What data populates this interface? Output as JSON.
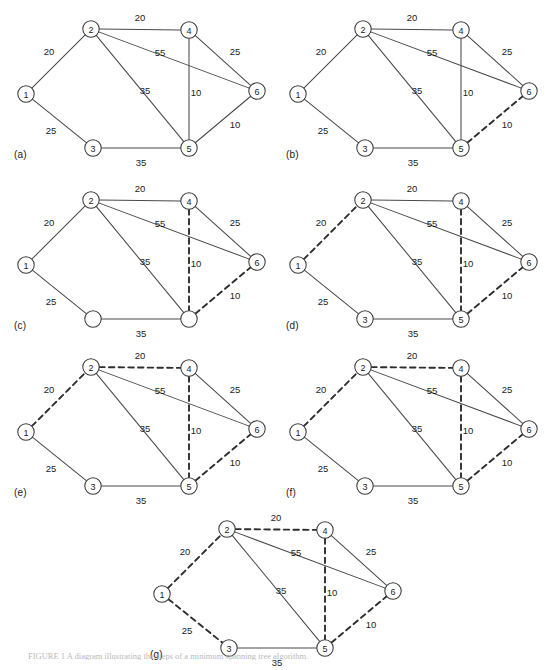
{
  "figure": {
    "caption_bottom": "FIGURE 1 A diagram illustrating the steps of a minimum spanning tree algorithm.",
    "node_radius": 8.2,
    "nodes": [
      {
        "id": "1",
        "label": "1",
        "x": 26,
        "y": 94
      },
      {
        "id": "2",
        "label": "2",
        "x": 91,
        "y": 29
      },
      {
        "id": "3",
        "label": "3",
        "x": 93,
        "y": 148
      },
      {
        "id": "4",
        "label": "4",
        "x": 189,
        "y": 30
      },
      {
        "id": "5",
        "label": "5",
        "x": 189,
        "y": 148
      },
      {
        "id": "6",
        "label": "6",
        "x": 257,
        "y": 91
      }
    ],
    "edges": [
      {
        "id": "1-2",
        "from": "1",
        "to": "2",
        "weight": "20",
        "lx": 49,
        "ly": 51
      },
      {
        "id": "1-3",
        "from": "1",
        "to": "3",
        "weight": "25",
        "lx": 51,
        "ly": 130
      },
      {
        "id": "2-4",
        "from": "2",
        "to": "4",
        "weight": "20",
        "lx": 140,
        "ly": 17
      },
      {
        "id": "2-6",
        "from": "2",
        "to": "6",
        "weight": "55",
        "lx": 160,
        "ly": 52
      },
      {
        "id": "2-5",
        "from": "2",
        "to": "5",
        "weight": "35",
        "lx": 145,
        "ly": 90
      },
      {
        "id": "4-6",
        "from": "4",
        "to": "6",
        "weight": "25",
        "lx": 235,
        "ly": 51
      },
      {
        "id": "4-5",
        "from": "4",
        "to": "5",
        "weight": "10",
        "lx": 196,
        "ly": 92
      },
      {
        "id": "5-6",
        "from": "5",
        "to": "6",
        "weight": "10",
        "lx": 235,
        "ly": 124
      },
      {
        "id": "3-5",
        "from": "3",
        "to": "5",
        "weight": "35",
        "lx": 141,
        "ly": 162
      }
    ],
    "panels": [
      {
        "key": "a",
        "label": "(a)",
        "x": 0,
        "y": 0,
        "label_x": 14,
        "label_y": 149,
        "dashed": [],
        "blank_nodes": []
      },
      {
        "key": "b",
        "label": "(b)",
        "x": 272,
        "y": 0,
        "label_x": 14,
        "label_y": 149,
        "dashed": [
          "5-6"
        ],
        "blank_nodes": []
      },
      {
        "key": "c",
        "label": "(c)",
        "x": 0,
        "y": 171,
        "label_x": 14,
        "label_y": 149,
        "dashed": [
          "5-6",
          "4-5"
        ],
        "blank_nodes": [
          "3",
          "5"
        ]
      },
      {
        "key": "d",
        "label": "(d)",
        "x": 272,
        "y": 171,
        "label_x": 14,
        "label_y": 149,
        "dashed": [
          "5-6",
          "4-5",
          "1-2"
        ],
        "blank_nodes": []
      },
      {
        "key": "e",
        "label": "(e)",
        "x": 0,
        "y": 338,
        "label_x": 14,
        "label_y": 149,
        "dashed": [
          "5-6",
          "4-5",
          "1-2",
          "2-4"
        ],
        "blank_nodes": []
      },
      {
        "key": "f",
        "label": "(f)",
        "x": 272,
        "y": 338,
        "label_x": 14,
        "label_y": 149,
        "dashed": [
          "5-6",
          "4-5",
          "1-2",
          "2-4"
        ],
        "blank_nodes": []
      },
      {
        "key": "g",
        "label": "(g)",
        "x": 136,
        "y": 500,
        "label_x": 14,
        "label_y": 149,
        "dashed": [
          "5-6",
          "4-5",
          "1-2",
          "2-4",
          "1-3"
        ],
        "blank_nodes": []
      }
    ]
  }
}
